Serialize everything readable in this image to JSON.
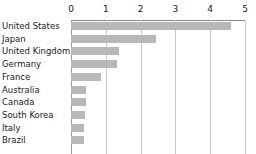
{
  "chart_data": {
    "type": "bar",
    "orientation": "horizontal",
    "title": "",
    "subtitle": "",
    "xlabel": "",
    "ylabel": "",
    "categories": [
      "United States",
      "Japan",
      "United Kingdom",
      "Germany",
      "France",
      "Australia",
      "Canada",
      "South Korea",
      "Italy",
      "Brazil"
    ],
    "values": [
      4.6,
      2.45,
      1.38,
      1.33,
      0.86,
      0.42,
      0.42,
      0.4,
      0.38,
      0.38
    ],
    "xlim": [
      0,
      5
    ],
    "xticks": [
      0,
      1,
      2,
      3,
      4,
      5
    ],
    "xtick_labels": [
      "0",
      "1",
      "2",
      "3",
      "4",
      "5"
    ],
    "grid": true,
    "grid_axis": "x",
    "axis_position": "top",
    "legend": false,
    "bar_color": "#b8b8b8",
    "gridline_color": "#c9c9c9",
    "axis_color": "#8a8a8a",
    "text_color": "#1a1a1a"
  }
}
